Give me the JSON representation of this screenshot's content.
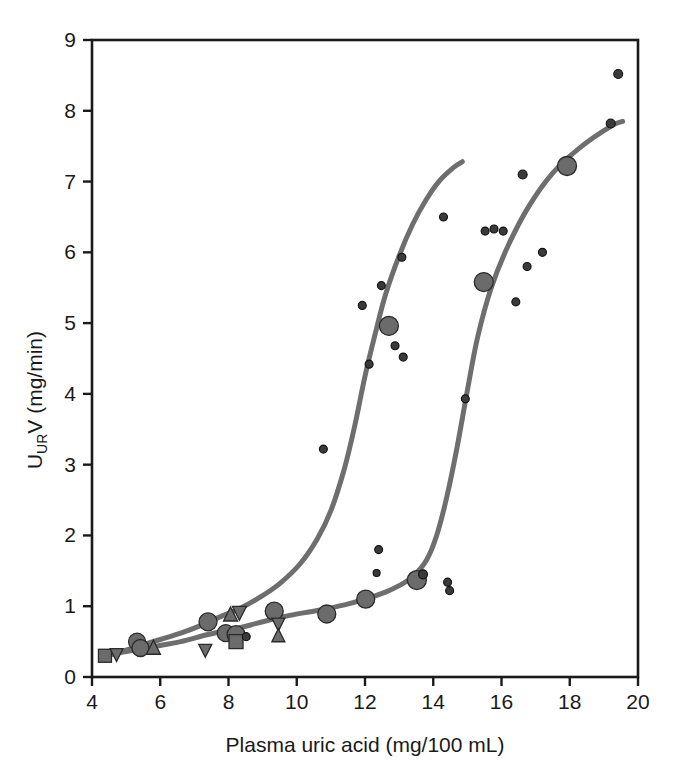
{
  "figure": {
    "background_color": "#ffffff",
    "frame_color": "#1a1a1a",
    "curve_color": "#6e6e6e",
    "marker_fill": "#6b6b6b",
    "marker_edge": "#2a2a2a",
    "smalldot_fill": "#3a3a3a"
  },
  "chart_data": {
    "type": "scatter",
    "title": "",
    "xlabel": "Plasma uric acid (mg/100 mL)",
    "ylabel": "U_URV (mg/min)",
    "ylabel_main": "U",
    "ylabel_subscript": "UR",
    "ylabel_rest": "V (mg/min)",
    "xlim": [
      4,
      20
    ],
    "ylim": [
      0,
      9
    ],
    "xticks": [
      4,
      6,
      8,
      10,
      12,
      14,
      16,
      18,
      20
    ],
    "yticks": [
      0,
      1,
      2,
      3,
      4,
      5,
      6,
      7,
      8,
      9
    ],
    "xtick_labels": [
      "4",
      "6",
      "8",
      "10",
      "12",
      "14",
      "16",
      "18",
      "20"
    ],
    "ytick_labels": [
      "0",
      "1",
      "2",
      "3",
      "4",
      "5",
      "6",
      "7",
      "8",
      "9"
    ],
    "grid": false,
    "legend": "none",
    "series": [
      {
        "name": "curve-left",
        "type": "line",
        "color": "#6e6e6e",
        "width": 5,
        "points": [
          [
            4.35,
            0.3
          ],
          [
            4.8,
            0.35
          ],
          [
            5.4,
            0.44
          ],
          [
            6.0,
            0.53
          ],
          [
            6.6,
            0.62
          ],
          [
            7.2,
            0.73
          ],
          [
            7.8,
            0.86
          ],
          [
            8.3,
            0.96
          ],
          [
            8.9,
            1.12
          ],
          [
            9.5,
            1.32
          ],
          [
            10.1,
            1.6
          ],
          [
            10.6,
            1.95
          ],
          [
            11.0,
            2.35
          ],
          [
            11.4,
            2.95
          ],
          [
            11.7,
            3.55
          ],
          [
            12.0,
            4.25
          ],
          [
            12.3,
            4.85
          ],
          [
            12.6,
            5.4
          ],
          [
            13.0,
            5.95
          ],
          [
            13.4,
            6.4
          ],
          [
            13.8,
            6.75
          ],
          [
            14.2,
            7.02
          ],
          [
            14.6,
            7.2
          ],
          [
            14.85,
            7.28
          ]
        ]
      },
      {
        "name": "curve-right",
        "type": "line",
        "color": "#6e6e6e",
        "width": 5,
        "points": [
          [
            4.35,
            0.3
          ],
          [
            5.0,
            0.36
          ],
          [
            5.8,
            0.43
          ],
          [
            6.6,
            0.5
          ],
          [
            7.4,
            0.6
          ],
          [
            8.2,
            0.68
          ],
          [
            9.0,
            0.78
          ],
          [
            9.8,
            0.87
          ],
          [
            10.6,
            0.94
          ],
          [
            11.4,
            1.02
          ],
          [
            12.0,
            1.1
          ],
          [
            12.6,
            1.2
          ],
          [
            13.0,
            1.29
          ],
          [
            13.4,
            1.42
          ],
          [
            13.8,
            1.65
          ],
          [
            14.1,
            2.0
          ],
          [
            14.4,
            2.55
          ],
          [
            14.7,
            3.25
          ],
          [
            15.0,
            4.05
          ],
          [
            15.3,
            4.8
          ],
          [
            15.7,
            5.5
          ],
          [
            16.2,
            6.1
          ],
          [
            16.8,
            6.65
          ],
          [
            17.5,
            7.12
          ],
          [
            18.3,
            7.48
          ],
          [
            19.2,
            7.78
          ],
          [
            19.55,
            7.85
          ]
        ]
      }
    ],
    "markers": [
      {
        "shape": "square",
        "x": 4.38,
        "y": 0.3,
        "size": 13
      },
      {
        "shape": "triangle-down",
        "x": 4.72,
        "y": 0.31,
        "size": 13
      },
      {
        "shape": "circle",
        "x": 5.32,
        "y": 0.5,
        "size": 17
      },
      {
        "shape": "circle",
        "x": 5.42,
        "y": 0.41,
        "size": 17
      },
      {
        "shape": "triangle-up",
        "x": 5.8,
        "y": 0.42,
        "size": 14
      },
      {
        "shape": "triangle-down",
        "x": 7.32,
        "y": 0.37,
        "size": 13
      },
      {
        "shape": "circle",
        "x": 7.4,
        "y": 0.78,
        "size": 18
      },
      {
        "shape": "circle",
        "x": 7.92,
        "y": 0.62,
        "size": 17
      },
      {
        "shape": "triangle-up",
        "x": 8.06,
        "y": 0.89,
        "size": 14
      },
      {
        "shape": "triangle-down",
        "x": 8.32,
        "y": 0.9,
        "size": 14
      },
      {
        "shape": "circle",
        "x": 8.22,
        "y": 0.6,
        "size": 18
      },
      {
        "shape": "square",
        "x": 8.22,
        "y": 0.5,
        "size": 14
      },
      {
        "shape": "dot",
        "x": 8.52,
        "y": 0.57,
        "size": 8
      },
      {
        "shape": "circle",
        "x": 9.34,
        "y": 0.93,
        "size": 18
      },
      {
        "shape": "triangle-down",
        "x": 9.46,
        "y": 0.74,
        "size": 13
      },
      {
        "shape": "triangle-up",
        "x": 9.46,
        "y": 0.59,
        "size": 13
      },
      {
        "shape": "circle",
        "x": 10.88,
        "y": 0.89,
        "size": 18
      },
      {
        "shape": "circle",
        "x": 12.02,
        "y": 1.1,
        "size": 18
      },
      {
        "shape": "circle",
        "x": 13.52,
        "y": 1.37,
        "size": 19
      },
      {
        "shape": "dot",
        "x": 13.7,
        "y": 1.45,
        "size": 9
      },
      {
        "shape": "dot",
        "x": 14.42,
        "y": 1.34,
        "size": 8
      },
      {
        "shape": "dot",
        "x": 14.48,
        "y": 1.22,
        "size": 8
      },
      {
        "shape": "dot",
        "x": 12.4,
        "y": 1.8,
        "size": 8
      },
      {
        "shape": "dot",
        "x": 12.34,
        "y": 1.47,
        "size": 7
      },
      {
        "shape": "dot",
        "x": 10.78,
        "y": 3.22,
        "size": 8
      },
      {
        "shape": "dot",
        "x": 14.94,
        "y": 3.93,
        "size": 8
      },
      {
        "shape": "dot",
        "x": 12.12,
        "y": 4.42,
        "size": 8
      },
      {
        "shape": "dot",
        "x": 13.12,
        "y": 4.52,
        "size": 8
      },
      {
        "shape": "dot",
        "x": 12.88,
        "y": 4.68,
        "size": 8
      },
      {
        "shape": "circle",
        "x": 12.7,
        "y": 4.96,
        "size": 19
      },
      {
        "shape": "dot",
        "x": 11.92,
        "y": 5.25,
        "size": 8
      },
      {
        "shape": "dot",
        "x": 12.48,
        "y": 5.53,
        "size": 8
      },
      {
        "shape": "circle",
        "x": 15.48,
        "y": 5.58,
        "size": 19
      },
      {
        "shape": "dot",
        "x": 13.08,
        "y": 5.93,
        "size": 8
      },
      {
        "shape": "dot",
        "x": 16.42,
        "y": 5.3,
        "size": 8
      },
      {
        "shape": "dot",
        "x": 16.75,
        "y": 5.8,
        "size": 8
      },
      {
        "shape": "dot",
        "x": 17.2,
        "y": 6.0,
        "size": 8
      },
      {
        "shape": "dot",
        "x": 15.52,
        "y": 6.3,
        "size": 8
      },
      {
        "shape": "dot",
        "x": 15.78,
        "y": 6.33,
        "size": 8
      },
      {
        "shape": "dot",
        "x": 16.05,
        "y": 6.3,
        "size": 8
      },
      {
        "shape": "dot",
        "x": 14.3,
        "y": 6.5,
        "size": 8
      },
      {
        "shape": "dot",
        "x": 16.62,
        "y": 7.1,
        "size": 9
      },
      {
        "shape": "circle",
        "x": 17.92,
        "y": 7.22,
        "size": 19
      },
      {
        "shape": "dot",
        "x": 19.2,
        "y": 7.82,
        "size": 9
      },
      {
        "shape": "dot",
        "x": 19.42,
        "y": 8.52,
        "size": 9
      }
    ]
  }
}
